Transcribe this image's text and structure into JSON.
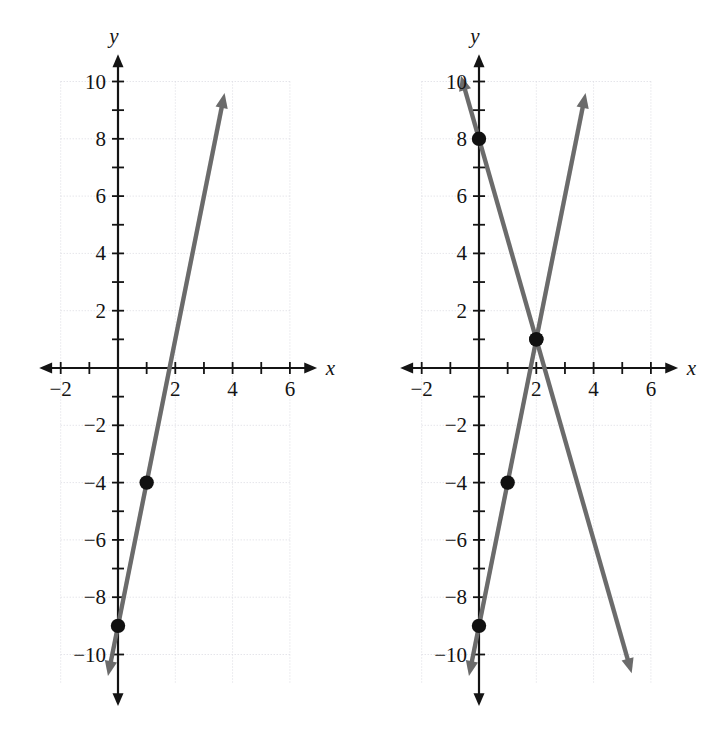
{
  "figure": {
    "title": "",
    "panel_count": 2,
    "background_color": "#ffffff",
    "line_color": "#6b6b6b",
    "axis_color": "#141414",
    "grid_color": "#d9d9e0",
    "point_color": "#111111"
  },
  "axes": {
    "x_label": "x",
    "y_label": "y",
    "x_ticks_labeled": [
      "-2",
      "2",
      "4",
      "6"
    ],
    "y_ticks_labeled": [
      "10",
      "8",
      "6",
      "4",
      "2",
      "-2",
      "-4",
      "-6",
      "-8",
      "-10"
    ],
    "x_min": -2.6,
    "x_max": 6.8,
    "y_min": -11.6,
    "y_max": 10.9,
    "x_tick_step": 1,
    "y_tick_step": 1,
    "grid_step": 2,
    "grid": "dotted"
  },
  "chart_data": [
    {
      "type": "line",
      "panel": "left",
      "title": "",
      "xlabel": "x",
      "ylabel": "y",
      "xlim": [
        -2.6,
        6.8
      ],
      "ylim": [
        -11.6,
        10.9
      ],
      "grid": true,
      "legend": "none",
      "series": [
        {
          "name": "y = 5x - 9",
          "slope": 5,
          "intercept": -9,
          "color": "#6b6b6b",
          "arrows": "both",
          "x_start": -0.35,
          "x_end": 3.72,
          "points": [
            {
              "x": 0,
              "y": -9,
              "marker": "filled-circle"
            },
            {
              "x": 1,
              "y": -4,
              "marker": "filled-circle"
            }
          ]
        }
      ]
    },
    {
      "type": "line",
      "panel": "right",
      "title": "",
      "xlabel": "x",
      "ylabel": "y",
      "xlim": [
        -2.6,
        6.8
      ],
      "ylim": [
        -11.6,
        10.9
      ],
      "grid": true,
      "legend": "none",
      "series": [
        {
          "name": "y = 5x - 9",
          "slope": 5,
          "intercept": -9,
          "color": "#6b6b6b",
          "arrows": "both",
          "x_start": -0.35,
          "x_end": 3.72,
          "points": [
            {
              "x": 0,
              "y": -9,
              "marker": "filled-circle"
            },
            {
              "x": 1,
              "y": -4,
              "marker": "filled-circle"
            },
            {
              "x": 2,
              "y": 1,
              "marker": "filled-circle"
            }
          ]
        },
        {
          "name": "y = -3.5x + 8",
          "slope": -3.5,
          "intercept": 8,
          "color": "#6b6b6b",
          "arrows": "both",
          "x_start": -0.63,
          "x_end": 5.33,
          "points": [
            {
              "x": 0,
              "y": 8,
              "marker": "filled-circle"
            },
            {
              "x": 2,
              "y": 1,
              "marker": "filled-circle"
            }
          ]
        }
      ],
      "intersection": {
        "x": 2,
        "y": 1
      }
    }
  ]
}
